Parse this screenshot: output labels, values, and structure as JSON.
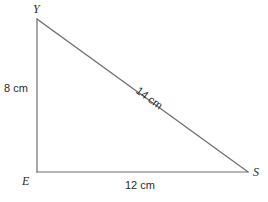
{
  "figure": {
    "type": "right-triangle-diagram",
    "background_color": "#ffffff",
    "stroke_color": "#6e6e6e",
    "text_color": "#2b2b2b"
  },
  "vertices": [
    {
      "name": "Y",
      "label": "Y",
      "x": 37,
      "y": 19
    },
    {
      "name": "E",
      "label": "E",
      "x": 37,
      "y": 172
    },
    {
      "name": "S",
      "label": "S",
      "x": 248,
      "y": 172
    }
  ],
  "sides": [
    {
      "name": "YE",
      "label": "8 cm",
      "length": 8,
      "unit": "cm",
      "orientation": "vertical"
    },
    {
      "name": "ES",
      "label": "12 cm",
      "length": 12,
      "unit": "cm",
      "orientation": "horizontal"
    },
    {
      "name": "YS",
      "label": "14 cm",
      "length": 14,
      "unit": "cm",
      "orientation": "hypotenuse",
      "rotation_deg": 35.9
    }
  ]
}
